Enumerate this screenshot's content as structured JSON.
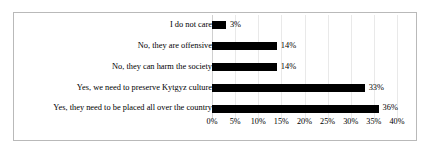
{
  "chart_data": {
    "type": "bar",
    "orientation": "horizontal",
    "title": "",
    "xlabel": "",
    "ylabel": "",
    "xlim": [
      0,
      40
    ],
    "grid": true,
    "legend": false,
    "categories": [
      "I do not care",
      "No, they are offensive",
      "No, they can harm the society",
      "Yes, we need to preserve Kytgyz culture",
      "Yes, they need to be placed all over the country"
    ],
    "values": [
      3,
      14,
      14,
      33,
      36
    ],
    "value_labels": [
      "3%",
      "14%",
      "14%",
      "33%",
      "36%"
    ],
    "xticks": [
      0,
      5,
      10,
      15,
      20,
      25,
      30,
      35,
      40
    ],
    "xtick_labels": [
      "0%",
      "5%",
      "10%",
      "15%",
      "20%",
      "25%",
      "30%",
      "35%",
      "40%"
    ],
    "bar_color": "#000000",
    "grid_color": "#e9e9e9",
    "border_color": "#b9b9b9"
  }
}
